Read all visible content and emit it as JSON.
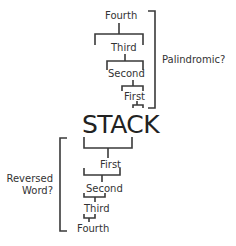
{
  "diagram": {
    "center_label": "STACK",
    "top_stack": {
      "items": [
        "Fourth",
        "Third",
        "Second",
        "First"
      ],
      "bracket_label": "Palindromic?"
    },
    "bottom_stack": {
      "items": [
        "First",
        "Second",
        "Third",
        "Fourth"
      ],
      "bracket_label_line1": "Reversed",
      "bracket_label_line2": "Word?"
    },
    "colors": {
      "line": "#3a3a3a",
      "text": "#333333",
      "background": "#ffffff"
    }
  }
}
